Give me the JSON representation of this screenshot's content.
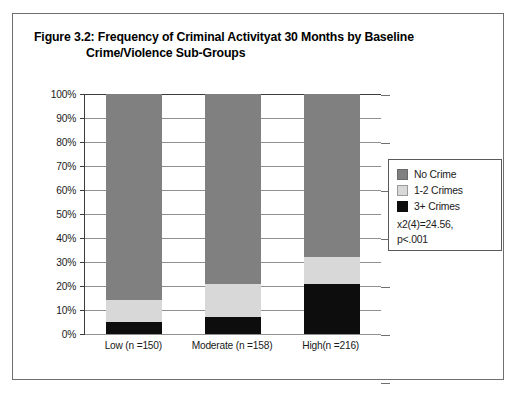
{
  "figure": {
    "title_line_1": "Figure 3.2: Frequency of Criminal Activityat 30  Months by Baseline",
    "title_line_2": "Crime/Violence Sub-Groups"
  },
  "legend": {
    "items": [
      {
        "label": "No Crime",
        "color": "#808080",
        "swatch_class": "sw-no-crime"
      },
      {
        "label": "1-2 Crimes",
        "color": "#d8d8d8",
        "swatch_class": "sw-1-2-crimes"
      },
      {
        "label": "3+ Crimes",
        "color": "#0d0d0d",
        "swatch_class": "sw-3plus"
      }
    ],
    "stat_line_1": "x2(4)=24.56,",
    "stat_line_2": "p<.001"
  },
  "chart_data": {
    "type": "bar",
    "subtype": "stacked-percentage-column",
    "title": "Figure 3.2: Frequency of Criminal Activityat 30  Months by Baseline Crime/Violence Sub-Groups",
    "xlabel": "",
    "ylabel": "",
    "ylim": [
      0,
      100
    ],
    "yticks": [
      "0%",
      "10%",
      "20%",
      "30%",
      "40%",
      "50%",
      "60%",
      "70%",
      "80%",
      "90%",
      "100%"
    ],
    "ytick_values": [
      0,
      10,
      20,
      30,
      40,
      50,
      60,
      70,
      80,
      90,
      100
    ],
    "grid": true,
    "legend_position": "right",
    "categories": [
      "Low (n =150)",
      "Moderate (n =158)",
      "High(n =216)"
    ],
    "series": [
      {
        "name": "3+ Crimes",
        "color": "#0d0d0d",
        "values": [
          5,
          7,
          21
        ]
      },
      {
        "name": "1-2 Crimes",
        "color": "#d8d8d8",
        "values": [
          9,
          14,
          11
        ]
      },
      {
        "name": "No Crime",
        "color": "#808080",
        "values": [
          86,
          79,
          68
        ]
      }
    ],
    "annotations": [
      "x2(4)=24.56,",
      "p<.001"
    ]
  }
}
